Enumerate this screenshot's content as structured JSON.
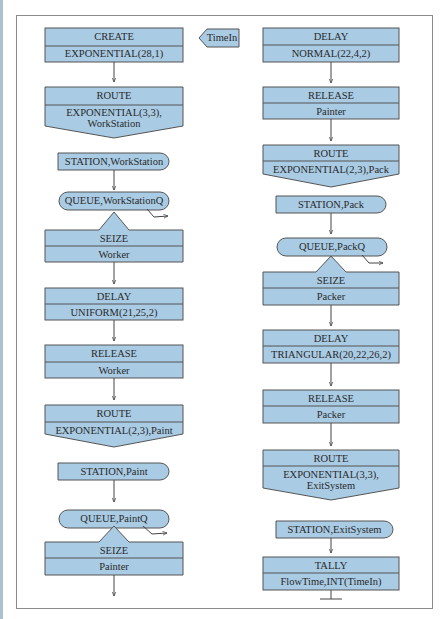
{
  "diagram": {
    "type": "SIMAN/Arena block flowchart",
    "colors": {
      "block_fill": "#a9cbe4",
      "block_stroke": "#555555",
      "arrow": "#444444",
      "frame": "#8a8a8a"
    },
    "left_column": [
      {
        "id": "create",
        "shape": "rect2",
        "header": "CREATE",
        "body": "EXPONENTIAL(28,1)"
      },
      {
        "id": "route-workstation",
        "shape": "route",
        "header": "ROUTE",
        "body": "EXPONENTIAL(3,3),",
        "body2": "WorkStation"
      },
      {
        "id": "station-workstation",
        "shape": "station",
        "label": "STATION,WorkStation"
      },
      {
        "id": "queue-workstationq",
        "shape": "queue",
        "label": "QUEUE,WorkStationQ"
      },
      {
        "id": "seize-worker",
        "shape": "seize",
        "header": "SEIZE",
        "body": "Worker"
      },
      {
        "id": "delay-uniform",
        "shape": "rect2",
        "header": "DELAY",
        "body": "UNIFORM(21,25,2)"
      },
      {
        "id": "release-worker",
        "shape": "rect2",
        "header": "RELEASE",
        "body": "Worker"
      },
      {
        "id": "route-paint",
        "shape": "route",
        "header": "ROUTE",
        "body": "EXPONENTIAL(2,3),Paint"
      },
      {
        "id": "station-paint",
        "shape": "station",
        "label": "STATION,Paint"
      },
      {
        "id": "queue-paintq",
        "shape": "queue",
        "label": "QUEUE,PaintQ"
      },
      {
        "id": "seize-painter",
        "shape": "seize",
        "header": "SEIZE",
        "body": "Painter"
      }
    ],
    "attribute_tag": {
      "label": "TimeIn"
    },
    "right_column": [
      {
        "id": "delay-normal",
        "shape": "rect2",
        "header": "DELAY",
        "body": "NORMAL(22,4,2)"
      },
      {
        "id": "release-painter",
        "shape": "rect2",
        "header": "RELEASE",
        "body": "Painter"
      },
      {
        "id": "route-pack",
        "shape": "route",
        "header": "ROUTE",
        "body": "EXPONENTIAL(2,3),Pack"
      },
      {
        "id": "station-pack",
        "shape": "station",
        "label": "STATION,Pack"
      },
      {
        "id": "queue-packq",
        "shape": "queue",
        "label": "QUEUE,PackQ"
      },
      {
        "id": "seize-packer",
        "shape": "seize",
        "header": "SEIZE",
        "body": "Packer"
      },
      {
        "id": "delay-triangular",
        "shape": "rect2",
        "header": "DELAY",
        "body": "TRIANGULAR(20,22,26,2)"
      },
      {
        "id": "release-packer",
        "shape": "rect2",
        "header": "RELEASE",
        "body": "Packer"
      },
      {
        "id": "route-exitsystem",
        "shape": "route",
        "header": "ROUTE",
        "body": "EXPONENTIAL(3,3),",
        "body2": "ExitSystem"
      },
      {
        "id": "station-exitsystem",
        "shape": "station",
        "label": "STATION,ExitSystem"
      },
      {
        "id": "tally-flowtime",
        "shape": "rect2",
        "header": "TALLY",
        "body": "FlowTime,INT(TimeIn)"
      }
    ]
  }
}
